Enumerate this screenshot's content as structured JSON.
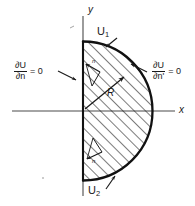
{
  "figure": {
    "type": "math-diagram",
    "axes": {
      "x_label": "x",
      "y_label": "y",
      "origin_label": ""
    },
    "labels": {
      "upper_region": "U",
      "upper_region_sub": "1",
      "lower_region": "U",
      "lower_region_sub": "2",
      "radius": "R"
    },
    "boundary_conditions": [
      {
        "id": "left",
        "numerator": "∂U",
        "denominator": "∂n",
        "equals": "= 0",
        "side": "left",
        "arrow": "arrow-pointing-right-down"
      },
      {
        "id": "right",
        "numerator": "∂U",
        "denominator": "∂n'",
        "equals": "= 0",
        "side": "right",
        "arrow": "arrow-pointing-left"
      }
    ],
    "normals": [
      {
        "id": "upper-normal",
        "symbol": "n"
      },
      {
        "id": "lower-normal",
        "symbol": "n"
      }
    ],
    "colors": {
      "ink": "#1a1a1a",
      "axis": "#4a4a4a",
      "hatch": "#1a1a1a",
      "background": "#ffffff"
    },
    "geometry": {
      "center_x": 83,
      "center_y": 111,
      "radius_px": 70,
      "arc_top_y": 42,
      "arc_bottom_y": 181,
      "arc_right_x": 152
    }
  }
}
